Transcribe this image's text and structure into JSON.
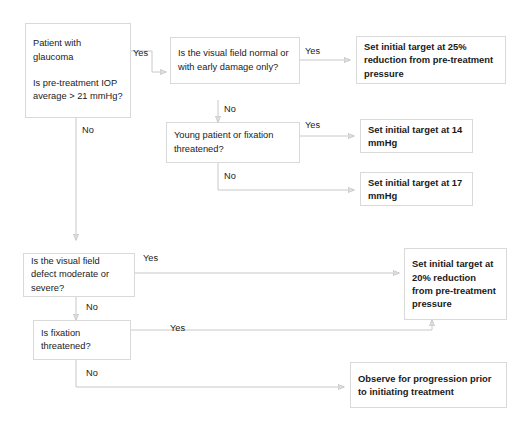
{
  "diagram": {
    "line_color": "#c8c8c8",
    "box_border_color": "#d9d9d9",
    "text_color": "#1a1a1a"
  },
  "nodes": {
    "patient": "Patient with glaucoma\n\nIs pre-treatment IOP  average > 21 mmHg?",
    "visual_field_normal": "Is the visual field normal or with early damage only?",
    "young_or_fixation": "Young patient or fixation threatened?",
    "vf_defect_moderate": "Is the visual field defect moderate or severe?",
    "is_fixation_threatened": "Is fixation threatened?",
    "target_25": "Set initial target at 25% reduction from pre-treatment pressure",
    "target_14": "Set initial target at 14 mmHg",
    "target_17": "Set initial target at 17 mmHg",
    "target_20": "Set initial target at 20% reduction from pre-treatment pressure",
    "observe": "Observe for progression prior to initiating treatment"
  },
  "edge_labels": {
    "patient_yes": "Yes",
    "patient_no": "No",
    "vf_normal_yes": "Yes",
    "vf_normal_no": "No",
    "young_yes": "Yes",
    "young_no": "No",
    "defect_yes": "Yes",
    "defect_no": "No",
    "fixation_yes": "Yes",
    "fixation_no": "No"
  }
}
